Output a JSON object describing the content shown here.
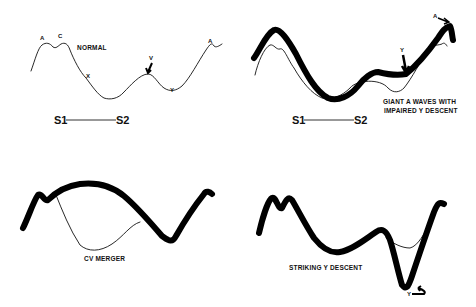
{
  "panels": [
    {
      "id": "normal",
      "title": "NORMAL",
      "wave_labels": [
        "A",
        "C",
        "X",
        "V",
        "Y",
        "A"
      ],
      "timing": {
        "start": "S1",
        "end": "S2"
      }
    },
    {
      "id": "giant-a-waves",
      "caption_line1": "GIANT A  WAVES WITH",
      "caption_line2": "IMPAIRED Y DESCENT",
      "wave_labels": [
        "Y",
        "A"
      ],
      "timing": {
        "start": "S1",
        "end": "S2"
      }
    },
    {
      "id": "cv-merger",
      "caption": "CV MERGER"
    },
    {
      "id": "striking-y-descent",
      "caption": "STRIKING Y DESCENT",
      "wave_labels": [
        "Y"
      ]
    }
  ],
  "colors": {
    "line": "#000000",
    "background": "#ffffff"
  }
}
